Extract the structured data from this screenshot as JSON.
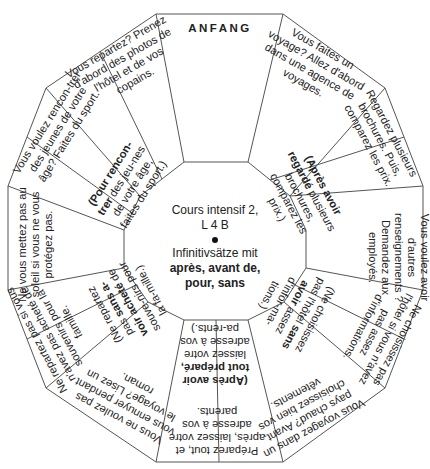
{
  "board": {
    "center": {
      "title_line1": "Cours intensif 2,",
      "title_line2": "L 4 B",
      "topic_line1": "Infinitivsätze mit",
      "topic_bold1": "après, avant de,",
      "topic_bold2": "pour, sans"
    },
    "sectors": [
      {
        "outer": "ANFANG",
        "inner": ""
      },
      {
        "outer": "Vous faites un voyage? Allez d'abord dans une agence de voyages.",
        "inner": ""
      },
      {
        "outer": "Regardez plusieurs brochures. Puis, comparez les prix.",
        "inner_bold": "(Après avoir regardé",
        "inner": "plusieurs brochures, comparez les prix.)"
      },
      {
        "outer": "Vous voulez avoir d'autres renseignements ? Demandez aux employés.",
        "inner": ""
      },
      {
        "outer": "Ne choisissez pas l'hôtel si vous n'avez pas assez d'informations.",
        "inner_pre": "(Ne choisissez pas l'hôtel",
        "inner_bold": "sans avoir",
        "inner": "assez d'infor-ma-tions.)"
      },
      {
        "outer": "Vous voyagez dans un pays chaud? Avant, choisissez bien vos vêtements.",
        "inner": ""
      },
      {
        "outer": "Préparez tout, et après, laissez votre adresse à vos parents.",
        "inner_bold_pre": "(Après avoir",
        "inner_bold": "tout préparé,",
        "inner": "laissez votre adresse à vos pa-rents.)"
      },
      {
        "outer": "Vous ne voulez pas vous ennuyer pendant le voyage? Lisez un roman.",
        "inner": ""
      },
      {
        "outer": "Ne repartez pas si vous n'avez pas acheté de souvenirs pour la famille.",
        "inner_pre": "(Ne repartez pas",
        "inner_bold": "sans a-voir acheté",
        "inner": "de souve-nirs pour la fa-mille.)"
      },
      {
        "outer": "Ne vous mettez pas au soleil si vous ne vous protégez pas.",
        "inner": ""
      },
      {
        "outer": "Vous voulez rencon-trer des jeunes de votre âge? Faites du sport.",
        "inner_bold": "(Pour rencon-trer",
        "inner": "des jeu-nes de votre âge, faites du sport.)"
      },
      {
        "outer": "Vous repartez? Prenez d'abord des photos de l'hôtel et de vos copains.",
        "inner": ""
      }
    ]
  },
  "colors": {
    "line": "#555555",
    "text": "#222222",
    "background": "#ffffff"
  }
}
